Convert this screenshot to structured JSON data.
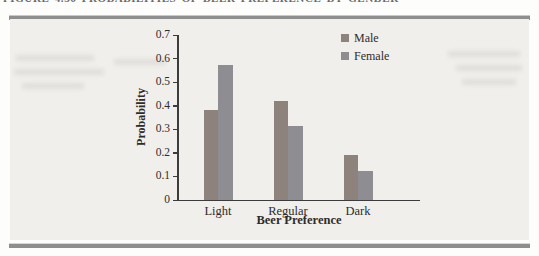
{
  "figure": {
    "caption_clipped": "FIGURE 4.36  PROBABILITIES OF BEER PREFERENCE BY GENDER"
  },
  "colors": {
    "page_bg": "#fdfdfc",
    "panel_bg": "#f0efec",
    "rule": "#8e8e8e",
    "axis": "#3c3c3c",
    "text": "#2e2c2a",
    "male_bar": "#8e827d",
    "female_bar": "#8e8d92"
  },
  "chart_data": {
    "type": "bar",
    "title": "",
    "categories": [
      "Light",
      "Regular",
      "Dark"
    ],
    "series": [
      {
        "name": "Male",
        "values": [
          0.38,
          0.42,
          0.19
        ],
        "color": "#8e827d"
      },
      {
        "name": "Female",
        "values": [
          0.57,
          0.31,
          0.12
        ],
        "color": "#8e8d92"
      }
    ],
    "xlabel": "Beer Preference",
    "ylabel": "Probability",
    "ylim": [
      0,
      0.7
    ],
    "yticks": [
      0,
      0.1,
      0.2,
      0.3,
      0.4,
      0.5,
      0.6,
      0.7
    ],
    "grid": false,
    "legend_position": "top-right-inside"
  }
}
